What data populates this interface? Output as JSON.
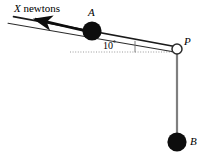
{
  "figure": {
    "background_color": "#ffffff",
    "width": 209,
    "height": 160
  },
  "labels": {
    "force_variable": "X",
    "force_unit": "newtons",
    "particle_a": "A",
    "pulley_p": "P",
    "particle_b": "B",
    "angle_value": "10",
    "angle_unit": "°"
  },
  "colors": {
    "stroke": "#1a1a1a",
    "incline_line": "#2b2b2b",
    "string_vertical": "#7f7f7f",
    "particle_fill": "#0d0d0d",
    "pulley_fill": "#ffffff",
    "pulley_stroke": "#2b2b2b",
    "dotted_guide": "#9a9a9a",
    "text": "#000000"
  },
  "geometry": {
    "incline_angle_degrees": 10,
    "incline_start": {
      "x": 8,
      "y": 23
    },
    "incline_end": {
      "x": 177,
      "y": 52
    },
    "surface_start": {
      "x": 14,
      "y": 17
    },
    "surface_end": {
      "x": 177,
      "y": 46
    },
    "particle_a_center": {
      "x": 92,
      "y": 31
    },
    "particle_a_radius": 9.5,
    "pulley_center": {
      "x": 177,
      "y": 49
    },
    "pulley_radius": 5,
    "particle_b_center": {
      "x": 177,
      "y": 142
    },
    "particle_b_radius": 9.5,
    "vertical_string_top": {
      "x": 177,
      "y": 53
    },
    "vertical_string_bottom": {
      "x": 177,
      "y": 142
    },
    "force_arrow_tail": {
      "x": 86,
      "y": 31
    },
    "force_arrow_head": {
      "x": 31,
      "y": 18
    },
    "dotted_guide_start": {
      "x": 70,
      "y": 52
    },
    "dotted_guide_end": {
      "x": 177,
      "y": 52
    },
    "angle_tick_x": 135,
    "angle_tick_top_y": 41,
    "angle_tick_bottom_y": 52
  }
}
